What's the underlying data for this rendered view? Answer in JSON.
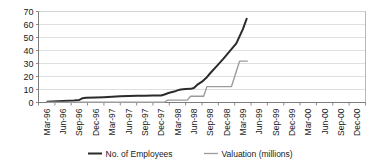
{
  "chart_data": {
    "type": "line",
    "title": "",
    "subtitle": "",
    "xlabel": "",
    "ylabel": "",
    "ylim": [
      0,
      70
    ],
    "yticks": [
      0,
      10,
      20,
      30,
      40,
      50,
      60,
      70
    ],
    "grid": true,
    "legend_position": "bottom",
    "categories": [
      "Mar-96",
      "Jun-96",
      "Sep-96",
      "Dec-96",
      "Mar-97",
      "Jun-97",
      "Sep-97",
      "Dec-97",
      "Mar-98",
      "Jun-98",
      "Sep-98",
      "Dec-98",
      "Mar-99",
      "Jun-99",
      "Sep-99",
      "Dec-99",
      "Mar-00",
      "Jun-00",
      "Sep-00",
      "Dec-00"
    ],
    "series": [
      {
        "name": "No. of Employees",
        "color": "#2b2b2b",
        "width": 2.0,
        "values": [
          1,
          1,
          3,
          4,
          5,
          5,
          5,
          5,
          9,
          11,
          20,
          40,
          62,
          null,
          null,
          null,
          null,
          null,
          null,
          null
        ],
        "dense_x": [
          0,
          0.33,
          0.66,
          1,
          1.33,
          1.66,
          2,
          2.2,
          2.4,
          3,
          3.5,
          4,
          4.5,
          5,
          5.5,
          6,
          6.5,
          7,
          7.2,
          7.5,
          7.8,
          8,
          8.2,
          8.5,
          8.8,
          9,
          9.2,
          9.5,
          9.8,
          10,
          10.4,
          10.8,
          11.2,
          11.6,
          12,
          12.25
        ],
        "dense_y": [
          0.6,
          0.8,
          1.0,
          1.2,
          1.4,
          1.6,
          2.0,
          3.3,
          3.6,
          3.8,
          4.1,
          4.4,
          4.8,
          5.0,
          5.1,
          5.2,
          5.3,
          5.4,
          6.2,
          7.5,
          8.4,
          9.3,
          10.0,
          10.3,
          10.5,
          11.2,
          13.5,
          16.0,
          19.5,
          22.5,
          28.0,
          33.5,
          39.5,
          45.5,
          56.5,
          65.0
        ]
      },
      {
        "name": "Valuation (millions)",
        "color": "#9b9b9b",
        "width": 1.4,
        "values": [
          0,
          0,
          0,
          0,
          0,
          0,
          0,
          0,
          1.8,
          4.8,
          12.2,
          12.2,
          31.8,
          null,
          null,
          null,
          null,
          null,
          null,
          null
        ],
        "dense_x": [
          0,
          7.2,
          7.4,
          8.0,
          8.6,
          8.8,
          9.4,
          9.6,
          9.8,
          11.3,
          11.5,
          11.8,
          12.3
        ],
        "dense_y": [
          0.2,
          0.2,
          1.8,
          1.8,
          1.8,
          4.8,
          4.8,
          4.8,
          12.2,
          12.2,
          20.0,
          31.8,
          31.8
        ]
      }
    ],
    "annotations": []
  },
  "legend": {
    "items": [
      {
        "label": "No. of Employees",
        "color": "#2b2b2b"
      },
      {
        "label": "Valuation (millions)",
        "color": "#9b9b9b"
      }
    ]
  },
  "axis": {
    "y_labels": [
      "70",
      "60",
      "50",
      "40",
      "30",
      "20",
      "10",
      "0"
    ],
    "x_labels": [
      "Mar-96",
      "Jun-96",
      "Sep-96",
      "Dec-96",
      "Mar-97",
      "Jun-97",
      "Sep-97",
      "Dec-97",
      "Mar-98",
      "Jun-98",
      "Sep-98",
      "Dec-98",
      "Mar-99",
      "Jun-99",
      "Sep-99",
      "Dec-99",
      "Mar-00",
      "Jun-00",
      "Sep-00",
      "Dec-00"
    ]
  },
  "colors": {
    "employees_line": "#2b2b2b",
    "valuation_line": "#9b9b9b",
    "gridline": "#c9c9c9",
    "axis": "#6e6e6e",
    "background": "#ffffff",
    "text": "#1a1a1a"
  }
}
